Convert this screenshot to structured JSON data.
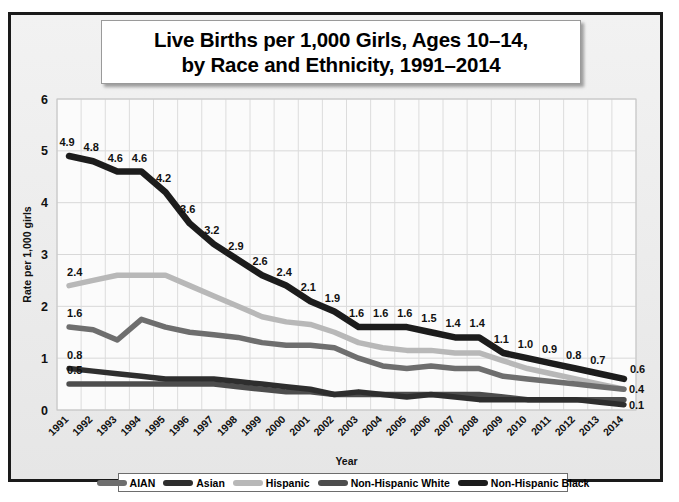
{
  "title": {
    "line1": "Live Births per 1,000 Girls, Ages 10–14,",
    "line2": "by Race and Ethnicity, 1991–2014"
  },
  "axes": {
    "ylabel": "Rate per 1,000 girls",
    "xlabel": "Year",
    "yticks": [
      "0",
      "1",
      "2",
      "3",
      "4",
      "5",
      "6"
    ]
  },
  "legend": {
    "items": [
      {
        "label": "AIAN",
        "color": "#6e6e6e"
      },
      {
        "label": "Asian",
        "color": "#2e2e2e"
      },
      {
        "label": "Hispanic",
        "color": "#b8b8b8"
      },
      {
        "label": "Non-Hispanic White",
        "color": "#4d4d4d"
      },
      {
        "label": "Non-Hispanic Black",
        "color": "#1c1c1c"
      }
    ]
  },
  "chart_data": {
    "type": "line",
    "title": "Live Births per 1,000 Girls, Ages 10–14, by Race and Ethnicity, 1991–2014",
    "xlabel": "Year",
    "ylabel": "Rate per 1,000 girls",
    "ylim": [
      0,
      6
    ],
    "yticks": [
      0,
      1,
      2,
      3,
      4,
      5,
      6
    ],
    "grid": true,
    "legend_position": "bottom",
    "x": [
      1991,
      1992,
      1993,
      1994,
      1995,
      1996,
      1997,
      1998,
      1999,
      2000,
      2001,
      2002,
      2003,
      2004,
      2005,
      2006,
      2007,
      2008,
      2009,
      2010,
      2011,
      2012,
      2013,
      2014
    ],
    "categories": [
      "1991",
      "1992",
      "1993",
      "1994",
      "1995",
      "1996",
      "1997",
      "1998",
      "1999",
      "2000",
      "2001",
      "2002",
      "2003",
      "2004",
      "2005",
      "2006",
      "2007",
      "2008",
      "2009",
      "2010",
      "2011",
      "2012",
      "2013",
      "2014"
    ],
    "series": [
      {
        "name": "Non-Hispanic Black",
        "color": "#1c1c1c",
        "values": [
          4.9,
          4.8,
          4.6,
          4.6,
          4.2,
          3.6,
          3.2,
          2.9,
          2.6,
          2.4,
          2.1,
          1.9,
          1.6,
          1.6,
          1.6,
          1.5,
          1.4,
          1.4,
          1.1,
          1.0,
          0.9,
          0.8,
          0.7,
          0.6
        ],
        "labels": [
          "4.9",
          "4.8",
          "4.6",
          "4.6",
          "4.2",
          "3.6",
          "3.2",
          "2.9",
          "2.6",
          "2.4",
          "2.1",
          "1.9",
          "1.6",
          "1.6",
          "1.6",
          "1.5",
          "1.4",
          "1.4",
          "1.1",
          "1.0",
          "0.9",
          "0.8",
          "0.7",
          "0.6"
        ]
      },
      {
        "name": "Hispanic",
        "color": "#b8b8b8",
        "values": [
          2.4,
          2.5,
          2.6,
          2.6,
          2.6,
          2.4,
          2.2,
          2.0,
          1.8,
          1.7,
          1.65,
          1.5,
          1.3,
          1.2,
          1.15,
          1.15,
          1.1,
          1.1,
          0.95,
          0.8,
          0.7,
          0.6,
          0.5,
          0.4
        ],
        "labels": [
          "2.4",
          "",
          "",
          "",
          "",
          "",
          "",
          "",
          "",
          "",
          "",
          "",
          "",
          "",
          "",
          "",
          "",
          "",
          "",
          "",
          "",
          "",
          "",
          "0.4"
        ]
      },
      {
        "name": "AIAN",
        "color": "#6e6e6e",
        "values": [
          1.6,
          1.55,
          1.35,
          1.75,
          1.6,
          1.5,
          1.45,
          1.4,
          1.3,
          1.25,
          1.25,
          1.2,
          1.0,
          0.85,
          0.8,
          0.85,
          0.8,
          0.8,
          0.65,
          0.6,
          0.55,
          0.5,
          0.45,
          0.4
        ],
        "labels": [
          "1.6",
          "",
          "",
          "",
          "",
          "",
          "",
          "",
          "",
          "",
          "",
          "",
          "",
          "",
          "",
          "",
          "",
          "",
          "",
          "",
          "",
          "",
          "",
          ""
        ]
      },
      {
        "name": "Asian",
        "color": "#2e2e2e",
        "values": [
          0.8,
          0.75,
          0.7,
          0.65,
          0.6,
          0.6,
          0.6,
          0.55,
          0.5,
          0.45,
          0.4,
          0.3,
          0.35,
          0.3,
          0.25,
          0.3,
          0.25,
          0.2,
          0.2,
          0.2,
          0.2,
          0.2,
          0.15,
          0.1
        ],
        "labels": [
          "0.8",
          "",
          "",
          "",
          "",
          "",
          "",
          "",
          "",
          "",
          "",
          "",
          "",
          "",
          "",
          "",
          "",
          "",
          "",
          "",
          "",
          "",
          "",
          "0.1"
        ]
      },
      {
        "name": "Non-Hispanic White",
        "color": "#4d4d4d",
        "values": [
          0.5,
          0.5,
          0.5,
          0.5,
          0.5,
          0.5,
          0.5,
          0.45,
          0.4,
          0.35,
          0.35,
          0.3,
          0.3,
          0.3,
          0.3,
          0.3,
          0.3,
          0.3,
          0.25,
          0.2,
          0.2,
          0.2,
          0.2,
          0.2
        ],
        "labels": [
          "0.5",
          "",
          "",
          "",
          "",
          "",
          "",
          "",
          "",
          "",
          "",
          "",
          "",
          "",
          "",
          "",
          "",
          "",
          "",
          "",
          "",
          "",
          "",
          ""
        ]
      }
    ],
    "data_label_positions": {
      "note": "Non-Hispanic Black series is labeled at every year; other series labeled only at first and last visible points."
    }
  }
}
